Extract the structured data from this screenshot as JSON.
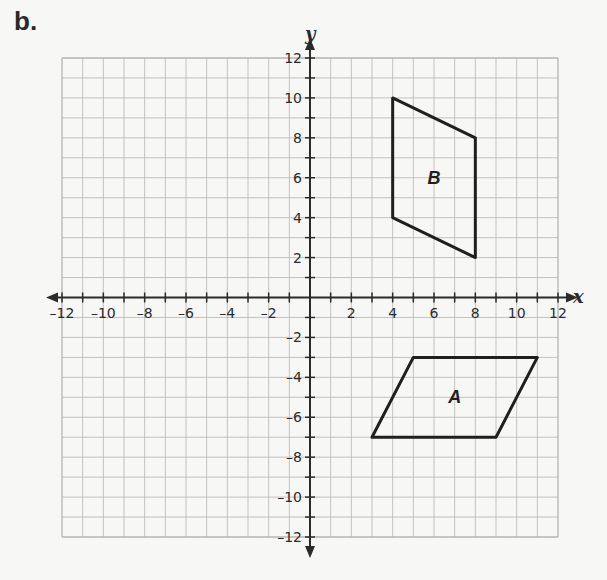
{
  "figure": {
    "part_label": "b.",
    "x_axis_label": "x",
    "y_axis_label": "y",
    "x_range": [
      -12,
      12
    ],
    "y_range": [
      -12,
      12
    ],
    "tick_step": 2,
    "x_tick_labels": [
      "-12",
      "-10",
      "-8",
      "-6",
      "-4",
      "-2",
      "2",
      "4",
      "6",
      "8",
      "10",
      "12"
    ],
    "y_tick_labels": [
      "12",
      "10",
      "8",
      "6",
      "4",
      "2",
      "-2",
      "-4",
      "-6",
      "-8",
      "-10",
      "-12"
    ],
    "grid": true,
    "colors": {
      "grid": "#b5b5b5",
      "axis": "#2b2b2b",
      "shape": "#1f1f1f",
      "background": "#f7f7f5"
    }
  },
  "shapes": [
    {
      "name": "B",
      "label": "B",
      "label_pos": [
        6,
        6
      ],
      "vertices": [
        [
          4,
          10
        ],
        [
          8,
          8
        ],
        [
          8,
          2
        ],
        [
          4,
          4
        ]
      ]
    },
    {
      "name": "A",
      "label": "A",
      "label_pos": [
        7,
        -5
      ],
      "vertices": [
        [
          5,
          -3
        ],
        [
          11,
          -3
        ],
        [
          9,
          -7
        ],
        [
          3,
          -7
        ]
      ]
    }
  ]
}
